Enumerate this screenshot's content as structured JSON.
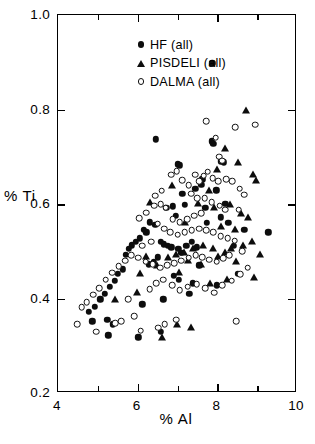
{
  "chart_data": {
    "type": "scatter",
    "title": "",
    "xlabel": "% Al",
    "ylabel": "% Ti",
    "xlim": [
      4,
      10
    ],
    "ylim": [
      0.2,
      1.0
    ],
    "xticks": [
      4,
      6,
      8,
      10
    ],
    "xtick_labels": [
      "4",
      "6",
      "8",
      "10"
    ],
    "xticks_minor": [
      5,
      7,
      9
    ],
    "yticks": [
      0.2,
      0.4,
      0.6,
      0.8,
      1.0
    ],
    "ytick_labels": [
      "0.2",
      "0.4",
      "0.6",
      "0.8",
      "1.0"
    ],
    "grid": false,
    "legend_position": "upper-left-inside",
    "series": [
      {
        "name": "HF (all)",
        "marker": "filled-circle",
        "color": "#0d0d0d",
        "points": [
          [
            7.87,
            0.898
          ],
          [
            6.45,
            0.737
          ],
          [
            7.0,
            0.684
          ],
          [
            7.06,
            0.682
          ],
          [
            7.86,
            0.733
          ],
          [
            7.9,
            0.728
          ],
          [
            8.09,
            0.69
          ],
          [
            8.16,
            0.688
          ],
          [
            7.6,
            0.64
          ],
          [
            7.62,
            0.652
          ],
          [
            7.45,
            0.632
          ],
          [
            7.12,
            0.621
          ],
          [
            7.18,
            0.598
          ],
          [
            6.88,
            0.595
          ],
          [
            6.72,
            0.592
          ],
          [
            6.95,
            0.575
          ],
          [
            7.97,
            0.629
          ],
          [
            6.3,
            0.561
          ],
          [
            6.44,
            0.556
          ],
          [
            6.16,
            0.546
          ],
          [
            6.22,
            0.54
          ],
          [
            6.05,
            0.527
          ],
          [
            5.96,
            0.52
          ],
          [
            5.86,
            0.513
          ],
          [
            5.78,
            0.505
          ],
          [
            5.7,
            0.492
          ],
          [
            6.58,
            0.52
          ],
          [
            6.66,
            0.515
          ],
          [
            6.76,
            0.512
          ],
          [
            6.84,
            0.508
          ],
          [
            7.02,
            0.505
          ],
          [
            7.1,
            0.497
          ],
          [
            7.22,
            0.512
          ],
          [
            7.36,
            0.52
          ],
          [
            7.48,
            0.508
          ],
          [
            6.5,
            0.487
          ],
          [
            6.4,
            0.478
          ],
          [
            6.28,
            0.472
          ],
          [
            5.62,
            0.462
          ],
          [
            5.5,
            0.452
          ],
          [
            5.42,
            0.438
          ],
          [
            5.3,
            0.425
          ],
          [
            5.18,
            0.41
          ],
          [
            5.06,
            0.398
          ],
          [
            4.92,
            0.382
          ],
          [
            4.78,
            0.372
          ],
          [
            4.86,
            0.352
          ],
          [
            5.24,
            0.355
          ],
          [
            5.38,
            0.345
          ],
          [
            5.26,
            0.322
          ],
          [
            6.02,
            0.318
          ],
          [
            6.9,
            0.448
          ],
          [
            7.04,
            0.44
          ],
          [
            7.38,
            0.432
          ],
          [
            7.55,
            0.47
          ],
          [
            8.28,
            0.56
          ],
          [
            8.68,
            0.545
          ],
          [
            9.28,
            0.54
          ],
          [
            8.52,
            0.452
          ],
          [
            8.42,
            0.512
          ],
          [
            7.98,
            0.428
          ],
          [
            7.3,
            0.41
          ],
          [
            6.64,
            0.398
          ],
          [
            6.12,
            0.388
          ],
          [
            7.7,
            0.592
          ],
          [
            7.74,
            0.56
          ],
          [
            6.58,
            0.33
          ],
          [
            8.2,
            0.6
          ],
          [
            8.08,
            0.572
          ]
        ]
      },
      {
        "name": "PISDELI (all)",
        "marker": "filled-triangle",
        "color": "#0d0d0d",
        "points": [
          [
            8.72,
            0.798
          ],
          [
            8.2,
            0.718
          ],
          [
            8.52,
            0.688
          ],
          [
            8.9,
            0.662
          ],
          [
            8.96,
            0.65
          ],
          [
            8.0,
            0.672
          ],
          [
            7.8,
            0.628
          ],
          [
            7.52,
            0.6
          ],
          [
            7.92,
            0.592
          ],
          [
            8.32,
            0.598
          ],
          [
            8.6,
            0.58
          ],
          [
            8.78,
            0.572
          ],
          [
            8.1,
            0.552
          ],
          [
            8.44,
            0.545
          ],
          [
            8.86,
            0.52
          ],
          [
            8.64,
            0.512
          ],
          [
            8.34,
            0.505
          ],
          [
            8.18,
            0.498
          ],
          [
            7.88,
            0.505
          ],
          [
            7.64,
            0.512
          ],
          [
            7.4,
            0.505
          ],
          [
            7.16,
            0.498
          ],
          [
            6.96,
            0.492
          ],
          [
            6.76,
            0.487
          ],
          [
            7.26,
            0.48
          ],
          [
            7.58,
            0.472
          ],
          [
            8.02,
            0.488
          ],
          [
            9.08,
            0.492
          ],
          [
            8.48,
            0.478
          ],
          [
            8.92,
            0.445
          ],
          [
            7.04,
            0.455
          ],
          [
            6.48,
            0.47
          ],
          [
            6.2,
            0.488
          ],
          [
            6.05,
            0.452
          ],
          [
            5.98,
            0.412
          ],
          [
            5.42,
            0.398
          ],
          [
            6.62,
            0.318
          ],
          [
            6.98,
            0.345
          ],
          [
            7.82,
            0.432
          ],
          [
            8.24,
            0.44
          ],
          [
            7.34,
            0.338
          ],
          [
            6.3,
            0.602
          ],
          [
            6.86,
            0.64
          ],
          [
            7.2,
            0.56
          ]
        ]
      },
      {
        "name": "DALMA (all)",
        "marker": "open-circle",
        "color": "#101010",
        "points": [
          [
            8.95,
            0.768
          ],
          [
            8.45,
            0.762
          ],
          [
            7.72,
            0.775
          ],
          [
            7.96,
            0.74
          ],
          [
            8.05,
            0.7
          ],
          [
            8.12,
            0.692
          ],
          [
            7.66,
            0.66
          ],
          [
            7.76,
            0.668
          ],
          [
            7.88,
            0.655
          ],
          [
            8.02,
            0.648
          ],
          [
            8.22,
            0.652
          ],
          [
            8.38,
            0.648
          ],
          [
            8.54,
            0.588
          ],
          [
            7.55,
            0.648
          ],
          [
            7.44,
            0.662
          ],
          [
            7.28,
            0.64
          ],
          [
            7.12,
            0.65
          ],
          [
            6.98,
            0.67
          ],
          [
            6.84,
            0.662
          ],
          [
            7.34,
            0.622
          ],
          [
            7.5,
            0.612
          ],
          [
            7.68,
            0.612
          ],
          [
            7.86,
            0.604
          ],
          [
            8.06,
            0.596
          ],
          [
            8.2,
            0.588
          ],
          [
            7.6,
            0.58
          ],
          [
            7.42,
            0.575
          ],
          [
            7.24,
            0.568
          ],
          [
            7.06,
            0.562
          ],
          [
            6.88,
            0.568
          ],
          [
            6.7,
            0.592
          ],
          [
            6.58,
            0.6
          ],
          [
            6.42,
            0.596
          ],
          [
            6.22,
            0.582
          ],
          [
            6.04,
            0.57
          ],
          [
            6.5,
            0.558
          ],
          [
            6.66,
            0.548
          ],
          [
            6.82,
            0.54
          ],
          [
            7.0,
            0.535
          ],
          [
            7.18,
            0.54
          ],
          [
            7.36,
            0.545
          ],
          [
            7.54,
            0.548
          ],
          [
            7.72,
            0.545
          ],
          [
            7.9,
            0.54
          ],
          [
            8.08,
            0.532
          ],
          [
            8.26,
            0.528
          ],
          [
            8.44,
            0.522
          ],
          [
            8.62,
            0.5
          ],
          [
            8.3,
            0.492
          ],
          [
            8.14,
            0.485
          ],
          [
            7.98,
            0.478
          ],
          [
            7.8,
            0.482
          ],
          [
            7.62,
            0.488
          ],
          [
            7.46,
            0.492
          ],
          [
            7.28,
            0.486
          ],
          [
            7.1,
            0.48
          ],
          [
            6.92,
            0.475
          ],
          [
            6.74,
            0.47
          ],
          [
            6.56,
            0.465
          ],
          [
            6.38,
            0.472
          ],
          [
            6.2,
            0.478
          ],
          [
            6.02,
            0.486
          ],
          [
            5.84,
            0.492
          ],
          [
            5.68,
            0.48
          ],
          [
            5.52,
            0.468
          ],
          [
            5.36,
            0.455
          ],
          [
            5.2,
            0.44
          ],
          [
            5.04,
            0.422
          ],
          [
            4.88,
            0.408
          ],
          [
            4.72,
            0.392
          ],
          [
            4.6,
            0.382
          ],
          [
            4.48,
            0.345
          ],
          [
            4.96,
            0.33
          ],
          [
            5.44,
            0.348
          ],
          [
            5.58,
            0.352
          ],
          [
            6.08,
            0.332
          ],
          [
            6.3,
            0.42
          ],
          [
            6.46,
            0.432
          ],
          [
            6.64,
            0.44
          ],
          [
            6.86,
            0.428
          ],
          [
            7.06,
            0.418
          ],
          [
            7.26,
            0.425
          ],
          [
            7.48,
            0.43
          ],
          [
            7.7,
            0.422
          ],
          [
            7.92,
            0.412
          ],
          [
            8.12,
            0.428
          ],
          [
            8.36,
            0.438
          ],
          [
            8.58,
            0.452
          ],
          [
            8.76,
            0.465
          ],
          [
            8.48,
            0.352
          ],
          [
            6.68,
            0.345
          ],
          [
            6.52,
            0.338
          ],
          [
            5.92,
            0.362
          ],
          [
            5.76,
            0.398
          ],
          [
            6.96,
            0.355
          ],
          [
            8.68,
            0.62
          ],
          [
            8.56,
            0.632
          ],
          [
            6.12,
            0.512
          ],
          [
            6.34,
            0.52
          ],
          [
            6.6,
            0.628
          ],
          [
            6.44,
            0.618
          ]
        ]
      }
    ]
  },
  "legend": {
    "entries": [
      {
        "label": "HF (all)",
        "marker": "filled-circle"
      },
      {
        "label": "PISDELI (all)",
        "marker": "filled-triangle"
      },
      {
        "label": "DALMA (all)",
        "marker": "open-circle"
      }
    ]
  }
}
